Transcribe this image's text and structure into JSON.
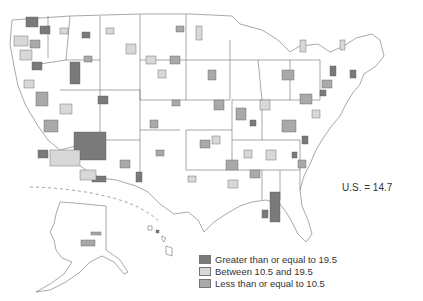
{
  "map": {
    "type": "choropleth",
    "region": "United States (metropolitan areas)",
    "colors": {
      "high": "#7a7a7a",
      "mid": "#d8d8d8",
      "low": "#a9a9a9",
      "border": "#6e6e6e",
      "background": "#ffffff"
    }
  },
  "annotation": {
    "us_value_label": "U.S. = 14.7"
  },
  "legend": {
    "items": [
      {
        "label": "Greater than or equal to 19.5",
        "color": "#7a7a7a"
      },
      {
        "label": "Between 10.5 and 19.5",
        "color": "#d8d8d8"
      },
      {
        "label": "Less than or equal to 10.5",
        "color": "#a9a9a9"
      }
    ]
  }
}
